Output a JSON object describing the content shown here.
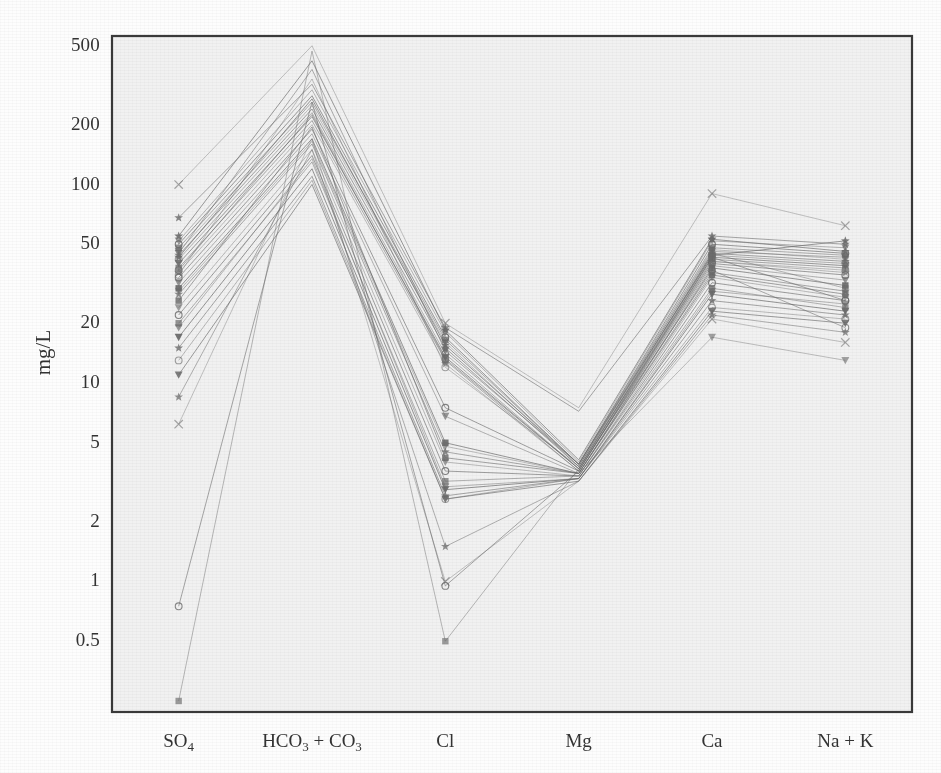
{
  "chart_data": {
    "type": "line",
    "subtype": "parallel-coordinates",
    "title": "",
    "xlabel": "",
    "ylabel": "mg/L",
    "yscale": "log",
    "ylim": [
      0.22,
      560
    ],
    "grid": false,
    "legend": "none",
    "categories": [
      "SO4",
      "HCO3 + CO3",
      "Cl",
      "Mg",
      "Ca",
      "Na + K"
    ],
    "category_labels_html": [
      "SO<sub>4</sub>",
      "HCO<sub>3</sub> + CO<sub>3</sub>",
      "Cl",
      "Mg",
      "Ca",
      "Na + K"
    ],
    "ytick_values": [
      500,
      200,
      100,
      50,
      20,
      10,
      5,
      2,
      1,
      0.5
    ],
    "ytick_labels": [
      "500",
      "200",
      "100",
      "50",
      "20",
      "10",
      "5",
      "2",
      "1",
      "0.5"
    ],
    "series": [
      {
        "name": "sample-01",
        "marker": "x",
        "values": [
          100,
          500,
          20.0,
          7.5,
          90,
          62
        ]
      },
      {
        "name": "sample-02",
        "marker": "star",
        "values": [
          68,
          320,
          19.0,
          7.2,
          55,
          50
        ]
      },
      {
        "name": "sample-03",
        "marker": "triangle",
        "values": [
          52,
          300,
          18.0,
          4.0,
          52,
          48
        ]
      },
      {
        "name": "sample-04",
        "marker": "circle",
        "values": [
          50,
          280,
          17.0,
          3.9,
          50,
          45
        ]
      },
      {
        "name": "sample-05",
        "marker": "square",
        "values": [
          48,
          260,
          16.5,
          3.9,
          48,
          44
        ]
      },
      {
        "name": "sample-06",
        "marker": "triangle",
        "values": [
          46,
          250,
          16.0,
          3.8,
          47,
          42
        ]
      },
      {
        "name": "sample-07",
        "marker": "star",
        "values": [
          44,
          240,
          15.0,
          3.8,
          45,
          41
        ]
      },
      {
        "name": "sample-08",
        "marker": "circle",
        "values": [
          42,
          230,
          14.0,
          3.7,
          44,
          40
        ]
      },
      {
        "name": "sample-09",
        "marker": "triangle",
        "values": [
          40,
          220,
          13.5,
          3.7,
          43,
          39
        ]
      },
      {
        "name": "sample-10",
        "marker": "square",
        "values": [
          38,
          210,
          13.0,
          3.6,
          42,
          38
        ]
      },
      {
        "name": "sample-11",
        "marker": "star",
        "values": [
          36,
          200,
          12.5,
          3.6,
          41,
          36
        ]
      },
      {
        "name": "sample-12",
        "marker": "circle",
        "values": [
          34,
          190,
          7.5,
          3.6,
          40,
          35
        ]
      },
      {
        "name": "sample-13",
        "marker": "triangle",
        "values": [
          32,
          180,
          6.8,
          3.5,
          39,
          33
        ]
      },
      {
        "name": "sample-14",
        "marker": "square",
        "values": [
          30,
          170,
          5.0,
          3.5,
          38,
          31
        ]
      },
      {
        "name": "sample-15",
        "marker": "star",
        "values": [
          28,
          160,
          4.5,
          3.5,
          36,
          29
        ]
      },
      {
        "name": "sample-16",
        "marker": "triangle",
        "values": [
          24,
          150,
          4.0,
          3.4,
          34,
          27
        ]
      },
      {
        "name": "sample-17",
        "marker": "circle",
        "values": [
          22,
          140,
          3.6,
          3.4,
          32,
          26
        ]
      },
      {
        "name": "sample-18",
        "marker": "square",
        "values": [
          20,
          130,
          3.2,
          3.4,
          30,
          24
        ]
      },
      {
        "name": "sample-19",
        "marker": "triangle",
        "values": [
          17,
          120,
          2.9,
          3.3,
          28,
          23
        ]
      },
      {
        "name": "sample-20",
        "marker": "star",
        "values": [
          15,
          110,
          2.7,
          3.3,
          26,
          22
        ]
      },
      {
        "name": "sample-21",
        "marker": "circle",
        "values": [
          13,
          105,
          2.6,
          3.3,
          24,
          21
        ]
      },
      {
        "name": "sample-22",
        "marker": "triangle",
        "values": [
          11,
          100,
          2.6,
          3.2,
          23,
          20
        ]
      },
      {
        "name": "sample-23",
        "marker": "star",
        "values": [
          8.5,
          150,
          1.5,
          3.2,
          22,
          18
        ]
      },
      {
        "name": "sample-24",
        "marker": "x",
        "values": [
          6.2,
          170,
          1.0,
          3.2,
          21,
          16
        ]
      },
      {
        "name": "sample-25",
        "marker": "circle",
        "values": [
          0.75,
          260,
          0.95,
          3.6,
          43,
          26
        ]
      },
      {
        "name": "sample-26",
        "marker": "square",
        "values": [
          0.25,
          470,
          0.5,
          3.7,
          45,
          30
        ]
      },
      {
        "name": "sample-27",
        "marker": "star",
        "values": [
          55,
          420,
          18.5,
          4.1,
          53,
          46
        ]
      },
      {
        "name": "sample-28",
        "marker": "triangle",
        "values": [
          45,
          380,
          14.5,
          3.9,
          46,
          43
        ]
      },
      {
        "name": "sample-29",
        "marker": "circle",
        "values": [
          35,
          340,
          12.0,
          3.8,
          41,
          37
        ]
      },
      {
        "name": "sample-30",
        "marker": "square",
        "values": [
          26,
          195,
          4.2,
          3.5,
          35,
          28
        ]
      },
      {
        "name": "sample-31",
        "marker": "triangle",
        "values": [
          19,
          135,
          3.0,
          3.3,
          29,
          25
        ]
      },
      {
        "name": "sample-32",
        "marker": "star",
        "values": [
          43,
          270,
          15.5,
          3.9,
          44,
          52
        ]
      },
      {
        "name": "sample-33",
        "marker": "circle",
        "values": [
          37,
          225,
          13.2,
          3.7,
          37,
          19
        ]
      },
      {
        "name": "sample-34",
        "marker": "triangle",
        "values": [
          29,
          165,
          4.8,
          3.5,
          17,
          13
        ]
      }
    ],
    "style": {
      "line_color": "#6b6b6b",
      "line_width": 0.9,
      "marker_color": "#6b6b6b",
      "frame_color": "#3a3a3a",
      "plot_background": "#f1f1f1",
      "page_background": "#fdfdfd",
      "text_color": "#333333"
    },
    "geometry": {
      "plot_left": 112,
      "plot_right": 912,
      "plot_top": 36,
      "plot_bottom": 712
    }
  }
}
